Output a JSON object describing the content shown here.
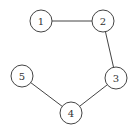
{
  "diagram": {
    "type": "graph",
    "directed": false,
    "node_radius": 11,
    "colors": {
      "stroke": "#444444",
      "fill": "#ffffff",
      "label": "#333333",
      "background": "#ffffff"
    },
    "nodes": [
      {
        "id": "1",
        "label": "1",
        "x": 41,
        "y": 21
      },
      {
        "id": "2",
        "label": "2",
        "x": 103,
        "y": 21
      },
      {
        "id": "3",
        "label": "3",
        "x": 116,
        "y": 78
      },
      {
        "id": "4",
        "label": "4",
        "x": 71,
        "y": 113
      },
      {
        "id": "5",
        "label": "5",
        "x": 22,
        "y": 76
      }
    ],
    "edges": [
      {
        "from": "1",
        "to": "2"
      },
      {
        "from": "2",
        "to": "3"
      },
      {
        "from": "3",
        "to": "4"
      },
      {
        "from": "4",
        "to": "5"
      }
    ]
  }
}
